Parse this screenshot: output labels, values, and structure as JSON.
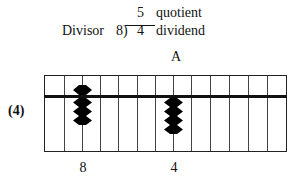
{
  "equation": {
    "divisor_label": "Divisor",
    "divisor": "8)",
    "quotient_value": "5",
    "quotient_label": "quotient",
    "dividend_value": "4",
    "dividend_label": "dividend"
  },
  "abacus": {
    "column_marker": "A",
    "step_label": "(4)",
    "rod_count": 12,
    "bead_rods": [
      {
        "rod_index": 2,
        "digit_label": "8",
        "heaven_beads_down": 1,
        "earth_beads_up": 3
      },
      {
        "rod_index": 7,
        "digit_label": "4",
        "heaven_beads_down": 0,
        "earth_beads_up": 4
      }
    ],
    "colors": {
      "frame": "#222222",
      "bead": "#000000",
      "beam": "#111111"
    }
  }
}
